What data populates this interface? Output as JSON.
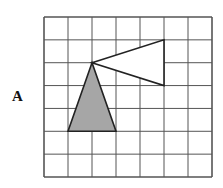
{
  "label": "A",
  "grid": {
    "cols": 7,
    "rows": 7,
    "x0": 44,
    "y0": 17,
    "x1": 212,
    "y1": 177
  },
  "shapes": [
    {
      "name": "white-triangle",
      "points": [
        [
          2,
          2
        ],
        [
          5,
          1
        ],
        [
          5,
          3
        ]
      ],
      "fill": "#ffffff"
    },
    {
      "name": "gray-triangle",
      "points": [
        [
          2,
          2
        ],
        [
          1,
          5
        ],
        [
          3,
          5
        ]
      ],
      "fill": "#a6a6a6"
    }
  ],
  "colors": {
    "grid": "#555555",
    "stroke": "#222222"
  }
}
